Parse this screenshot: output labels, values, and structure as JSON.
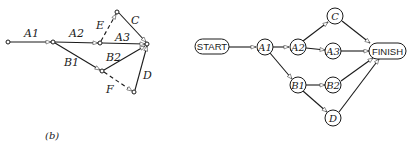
{
  "left_diagram": {
    "type": "activity-on-arrow network",
    "caption": "(b)",
    "activities": [
      {
        "id": "A1",
        "label": "A1",
        "style": "solid"
      },
      {
        "id": "A2",
        "label": "A2",
        "style": "solid"
      },
      {
        "id": "A3",
        "label": "A3",
        "style": "solid"
      },
      {
        "id": "B1",
        "label": "B1",
        "style": "solid"
      },
      {
        "id": "B2",
        "label": "B2",
        "style": "solid"
      },
      {
        "id": "C",
        "label": "C",
        "style": "solid"
      },
      {
        "id": "D",
        "label": "D",
        "style": "solid"
      },
      {
        "id": "E",
        "label": "E",
        "style": "dashed"
      },
      {
        "id": "F",
        "label": "F",
        "style": "dashed"
      }
    ]
  },
  "right_diagram": {
    "type": "activity-on-node network",
    "nodes": [
      {
        "id": "START",
        "label": "START"
      },
      {
        "id": "A1",
        "label": "A1"
      },
      {
        "id": "A2",
        "label": "A2"
      },
      {
        "id": "A3",
        "label": "A3"
      },
      {
        "id": "C",
        "label": "C"
      },
      {
        "id": "B1",
        "label": "B1"
      },
      {
        "id": "B2",
        "label": "B2"
      },
      {
        "id": "D",
        "label": "D"
      },
      {
        "id": "FINISH",
        "label": "FINISH"
      }
    ],
    "edges": [
      [
        "START",
        "A1"
      ],
      [
        "A1",
        "A2"
      ],
      [
        "A1",
        "B1"
      ],
      [
        "A2",
        "C"
      ],
      [
        "A2",
        "A3"
      ],
      [
        "B1",
        "B2"
      ],
      [
        "B1",
        "D"
      ],
      [
        "C",
        "FINISH"
      ],
      [
        "A3",
        "FINISH"
      ],
      [
        "B2",
        "FINISH"
      ],
      [
        "D",
        "FINISH"
      ]
    ]
  }
}
